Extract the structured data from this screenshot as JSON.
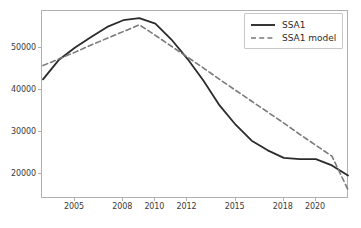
{
  "chart_data": {
    "type": "line",
    "title": "",
    "xlabel": "",
    "ylabel": "",
    "grid": false,
    "legend_position": "upper right",
    "x": [
      2003,
      2004,
      2005,
      2006,
      2007,
      2008,
      2009,
      2010,
      2011,
      2012,
      2013,
      2014,
      2015,
      2016,
      2017,
      2018,
      2019,
      2020,
      2021,
      2022
    ],
    "xtick_labels": [
      "2005",
      "2008",
      "2010",
      "2012",
      "2015",
      "2018",
      "2020"
    ],
    "xtick_values": [
      2005,
      2008,
      2010,
      2012,
      2015,
      2018,
      2020
    ],
    "ytick_labels": [
      "20000",
      "30000",
      "40000",
      "50000"
    ],
    "ytick_values": [
      20000,
      30000,
      40000,
      50000
    ],
    "ylim": [
      14000,
      58800
    ],
    "xlim": [
      2003,
      2022
    ],
    "series": [
      {
        "name": "SSA1",
        "style": "solid",
        "color": "#2b2b2b",
        "values": [
          42500,
          47200,
          50100,
          52600,
          55000,
          56600,
          57100,
          55800,
          52000,
          47400,
          42200,
          36300,
          31700,
          27900,
          25600,
          23800,
          23500,
          23500,
          22000,
          19600
        ]
      },
      {
        "name": "SSA1 model",
        "style": "dashed",
        "color": "#7a7a7a",
        "values": [
          45800,
          47400,
          49000,
          50700,
          52300,
          53900,
          55500,
          53000,
          50400,
          47800,
          45200,
          42500,
          39900,
          37300,
          34700,
          32100,
          29400,
          26800,
          24200,
          16200
        ]
      }
    ]
  },
  "legend": {
    "items": [
      {
        "label": "SSA1",
        "style": "solid",
        "color": "#2b2b2b"
      },
      {
        "label": "SSA1 model",
        "style": "dashed",
        "color": "#7a7a7a"
      }
    ]
  }
}
